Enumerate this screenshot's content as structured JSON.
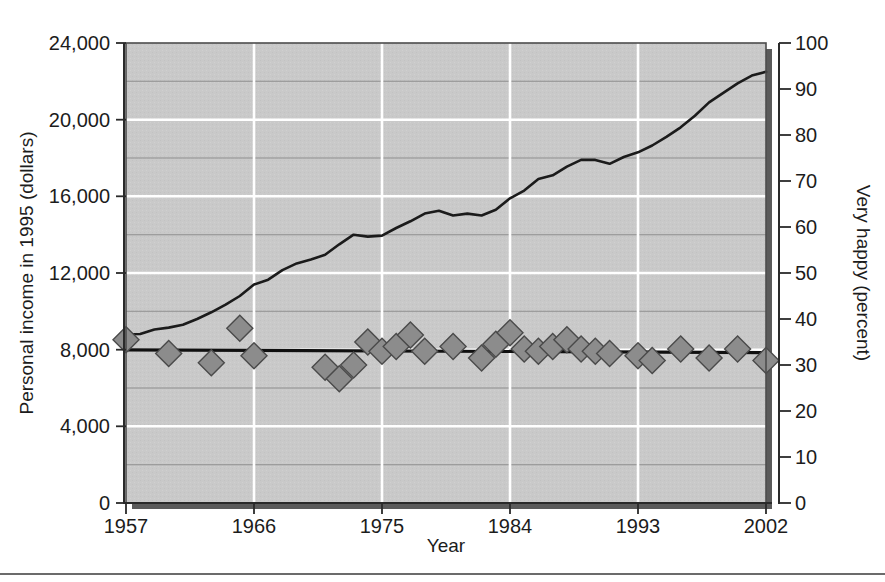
{
  "figure": {
    "background": "#ffffff",
    "plot_background": "#c8c8c8",
    "line_color": "#1b1b1b",
    "marker_fill": "#8c8c8c",
    "marker_stroke": "#4a4a4a",
    "major_gridline_color": "#ffffff",
    "minor_gridline_color": "#9a9a9a",
    "shadow_color": "#5a5a5a",
    "footer_rule": true
  },
  "chart_data": {
    "type": "line",
    "title": "",
    "subtitle": "",
    "xlabel": "Year",
    "ylabel": "Personal income in 1995 (dollars)",
    "y2label": "Very happy (percent)",
    "grid": true,
    "legend": "none",
    "xlim": [
      1957,
      2002
    ],
    "xticks": [
      "1957",
      "1966",
      "1975",
      "1984",
      "1993",
      "2002"
    ],
    "xtick_values": [
      1957,
      1966,
      1975,
      1984,
      1993,
      2002
    ],
    "ylim": [
      0,
      24000
    ],
    "yticks": [
      "0",
      "4,000",
      "8,000",
      "12,000",
      "16,000",
      "20,000",
      "24,000"
    ],
    "ytick_values": [
      0,
      4000,
      8000,
      12000,
      16000,
      20000,
      24000
    ],
    "y2lim": [
      0,
      100
    ],
    "y2ticks": [
      "0",
      "10",
      "20",
      "30",
      "40",
      "50",
      "60",
      "70",
      "80",
      "90",
      "100"
    ],
    "y2tick_values": [
      0,
      10,
      20,
      30,
      40,
      50,
      60,
      70,
      80,
      90,
      100
    ],
    "series": [
      {
        "name": "Personal income in 1995 (dollars)",
        "axis": "left",
        "style": "line",
        "x": [
          1957,
          1958,
          1959,
          1960,
          1961,
          1962,
          1963,
          1964,
          1965,
          1966,
          1967,
          1968,
          1969,
          1970,
          1971,
          1972,
          1973,
          1974,
          1975,
          1976,
          1977,
          1978,
          1979,
          1980,
          1981,
          1982,
          1983,
          1984,
          1985,
          1986,
          1987,
          1988,
          1989,
          1990,
          1991,
          1992,
          1993,
          1994,
          1995,
          1996,
          1997,
          1998,
          1999,
          2000,
          2001,
          2002
        ],
        "y": [
          8800,
          8820,
          9050,
          9150,
          9300,
          9600,
          9950,
          10350,
          10800,
          11400,
          11650,
          12150,
          12500,
          12700,
          12950,
          13500,
          14000,
          13900,
          13950,
          14350,
          14700,
          15100,
          15250,
          15000,
          15100,
          15000,
          15300,
          15900,
          16300,
          16900,
          17100,
          17550,
          17900,
          17900,
          17700,
          18050,
          18300,
          18650,
          19100,
          19600,
          20200,
          20900,
          21400,
          21900,
          22300,
          22500
        ]
      },
      {
        "name": "Very happy (percent)",
        "axis": "right",
        "style": "markers",
        "x": [
          1957,
          1960,
          1963,
          1965,
          1966,
          1971,
          1972,
          1973,
          1974,
          1975,
          1976,
          1977,
          1978,
          1980,
          1982,
          1983,
          1984,
          1985,
          1986,
          1987,
          1988,
          1989,
          1990,
          1991,
          1993,
          1994,
          1996,
          1998,
          2000,
          2002
        ],
        "y": [
          35.5,
          32.5,
          30.5,
          38.0,
          32.0,
          29.5,
          27.0,
          30.0,
          35.0,
          33.0,
          34.0,
          36.5,
          33.0,
          34.0,
          31.5,
          34.5,
          37.0,
          33.5,
          33.0,
          34.0,
          35.5,
          33.5,
          33.0,
          32.5,
          32.0,
          31.0,
          33.5,
          31.5,
          33.5,
          31.0
        ]
      },
      {
        "name": "Very happy trend",
        "axis": "right",
        "style": "trendline",
        "x": [
          1957,
          2002
        ],
        "y": [
          33.3,
          32.7
        ]
      }
    ]
  }
}
